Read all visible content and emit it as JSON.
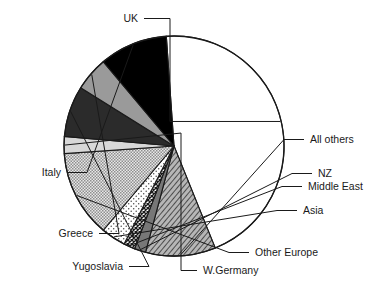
{
  "chart_data": {
    "type": "pie",
    "title": "",
    "xlabel": "",
    "ylabel": "",
    "legend_position": "callout-labels",
    "grid": false,
    "labels": [
      "UK",
      "All others",
      "NZ",
      "Middle East",
      "Asia",
      "Other Europe",
      "W.Germany",
      "Yugoslavia",
      "Greece",
      "Italy"
    ],
    "values": [
      45.0,
      10.5,
      1.6,
      1.6,
      3.6,
      12.7,
      2.6,
      7.3,
      5.1,
      10.0
    ],
    "units": "percent",
    "slices": [
      {
        "label": "UK",
        "value": 45.0,
        "fill": "white",
        "start_deg": -94,
        "end_deg": 68
      },
      {
        "label": "All others",
        "value": 10.5,
        "fill": "diagonal-hatch",
        "start_deg": 68,
        "end_deg": 105
      },
      {
        "label": "NZ",
        "value": 1.6,
        "fill": "solid-gray",
        "start_deg": 105,
        "end_deg": 111
      },
      {
        "label": "Middle East",
        "value": 1.6,
        "fill": "dark-crosshatch",
        "start_deg": 111,
        "end_deg": 117
      },
      {
        "label": "Asia",
        "value": 3.6,
        "fill": "light-dots",
        "start_deg": 117,
        "end_deg": 130
      },
      {
        "label": "Other Europe",
        "value": 12.7,
        "fill": "checker",
        "start_deg": 130,
        "end_deg": 176
      },
      {
        "label": "W.Germany",
        "value": 2.6,
        "fill": "light-gray",
        "start_deg": 176,
        "end_deg": 185
      },
      {
        "label": "Yugoslavia",
        "value": 7.3,
        "fill": "dark-charcoal",
        "start_deg": 185,
        "end_deg": 212
      },
      {
        "label": "Greece",
        "value": 5.1,
        "fill": "medium-gray",
        "start_deg": 212,
        "end_deg": 230
      },
      {
        "label": "Italy",
        "value": 10.0,
        "fill": "black",
        "start_deg": 230,
        "end_deg": 266
      }
    ],
    "colors": {
      "white": "#ffffff",
      "black": "#000000",
      "dark-charcoal": "#2b2b2b",
      "medium-gray": "#9a9a9a",
      "light-gray": "#d8d8d8",
      "solid-gray": "#777777",
      "outline": "#1a1a1a"
    },
    "callouts": [
      {
        "label": "UK",
        "text_x": 138,
        "text_y": 22,
        "anchor": "end"
      },
      {
        "label": "All others",
        "text_x": 310,
        "text_y": 143,
        "anchor": "start"
      },
      {
        "label": "NZ",
        "text_x": 318,
        "text_y": 177,
        "anchor": "start"
      },
      {
        "label": "Middle East",
        "text_x": 308,
        "text_y": 190,
        "anchor": "start"
      },
      {
        "label": "Asia",
        "text_x": 303,
        "text_y": 214,
        "anchor": "start"
      },
      {
        "label": "Other Europe",
        "text_x": 255,
        "text_y": 256,
        "anchor": "start"
      },
      {
        "label": "W.Germany",
        "text_x": 203,
        "text_y": 274,
        "anchor": "start"
      },
      {
        "label": "Yugoslavia",
        "text_x": 123,
        "text_y": 270,
        "anchor": "end"
      },
      {
        "label": "Greece",
        "text_x": 93,
        "text_y": 237,
        "anchor": "end"
      },
      {
        "label": "Italy",
        "text_x": 61,
        "text_y": 176,
        "anchor": "end"
      }
    ]
  }
}
